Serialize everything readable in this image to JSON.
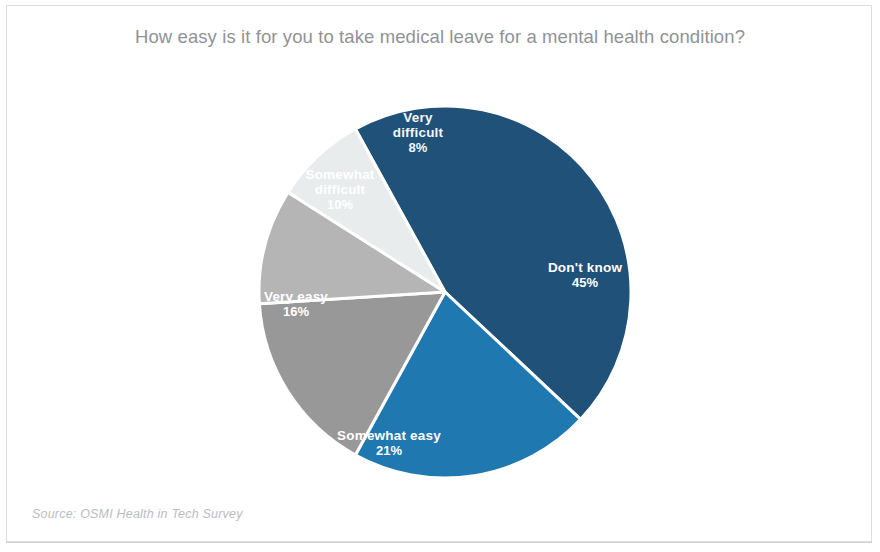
{
  "chart_title": "How easy is it for you to take medical leave for a mental health condition?",
  "source_note": "Source: OSMI Health in Tech Survey",
  "chart_data": {
    "type": "pie",
    "title": "How easy is it for you to take medical leave for a mental health condition?",
    "xlabel": "",
    "ylabel": "",
    "legend_position": "none",
    "labels_inside": true,
    "grid": false,
    "units": "percent",
    "total": 100,
    "categories": [
      "Don't know",
      "Somewhat easy",
      "Very easy",
      "Somewhat difficult",
      "Very difficult"
    ],
    "values": [
      45,
      21,
      16,
      10,
      8
    ],
    "colors": [
      "#205179",
      "#1f79b0",
      "#989898",
      "#b5b5b5",
      "#e8ecec"
    ],
    "slices": [
      {
        "label": "Don't know",
        "value": 45,
        "value_label": "45%",
        "color": "#205179",
        "label_lines": [
          "Don't know"
        ],
        "label_x": 585,
        "label_y": 272,
        "faint": false
      },
      {
        "label": "Somewhat easy",
        "value": 21,
        "value_label": "21%",
        "color": "#1f79b0",
        "label_lines": [
          "Somewhat easy"
        ],
        "label_x": 389,
        "label_y": 440,
        "faint": false
      },
      {
        "label": "Very easy",
        "value": 16,
        "value_label": "16%",
        "color": "#989898",
        "label_lines": [
          "Very easy"
        ],
        "label_x": 296,
        "label_y": 301,
        "faint": false
      },
      {
        "label": "Somewhat difficult",
        "value": 10,
        "value_label": "10%",
        "color": "#b5b5b5",
        "label_lines": [
          "Somewhat",
          "difficult"
        ],
        "label_x": 340,
        "label_y": 179,
        "faint": false
      },
      {
        "label": "Very difficult",
        "value": 8,
        "value_label": "8%",
        "color": "#e8ecec",
        "label_lines": [
          "Very",
          "difficult"
        ],
        "label_x": 418,
        "label_y": 122,
        "faint": true
      }
    ],
    "geometry": {
      "cx": 445,
      "cy": 292,
      "r": 186,
      "start_angle_deg": -28.8,
      "direction": "clockwise"
    }
  }
}
